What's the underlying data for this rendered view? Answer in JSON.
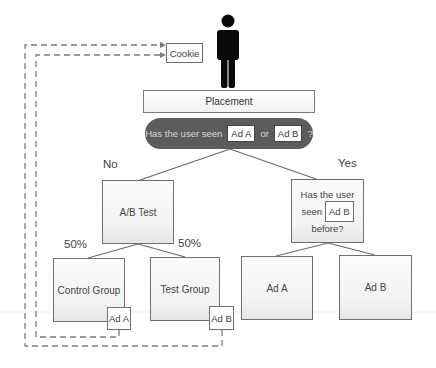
{
  "diagram": {
    "user_icon": "person-icon",
    "cookie": {
      "label": "Cookie"
    },
    "placement": {
      "label": "Placement"
    },
    "decision": {
      "prefix": "Has the user seen",
      "option_a": "Ad A",
      "connector": "or",
      "option_b": "Ad B",
      "suffix": "?"
    },
    "branches": {
      "no": {
        "label": "No"
      },
      "yes": {
        "label": "Yes"
      }
    },
    "ab_test": {
      "label": "A/B Test"
    },
    "split": {
      "left_pct": "50%",
      "right_pct": "50%"
    },
    "control_group": {
      "label": "Control Group",
      "tag": "Ad A"
    },
    "test_group": {
      "label": "Test Group",
      "tag": "Ad B"
    },
    "seen_question": {
      "line1": "Has the user",
      "line2_prefix": "seen",
      "ad": "Ad B",
      "line3": "before?"
    },
    "outcomes": {
      "left": {
        "label": "Ad A"
      },
      "right": {
        "label": "Ad B"
      }
    },
    "colors": {
      "decision_fill": "#5c5c5c",
      "box_border": "#6f6f6f",
      "dashed_line": "#7a7a7a",
      "person": "#0a0a0a"
    }
  }
}
